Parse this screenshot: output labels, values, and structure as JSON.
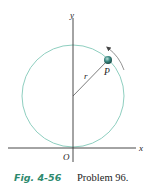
{
  "figure": {
    "axes": {
      "x_label": "x",
      "y_label": "y",
      "origin_label": "O"
    },
    "radius_label": "r",
    "point_label": "P",
    "colors": {
      "circle": "#8fcfc0",
      "axis": "#333333",
      "caption_accent": "#2e8a6e",
      "particle": "#2f6f6a"
    }
  },
  "caption": {
    "figure_number": "Fig. 4-56",
    "text": "Problem 96."
  }
}
